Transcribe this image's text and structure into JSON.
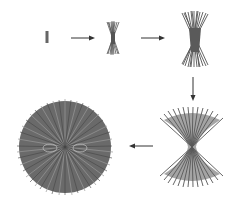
{
  "diagram": {
    "colors": {
      "fiber": "#555555",
      "fiber_light": "#8a8a8a",
      "arrow": "#333333",
      "background": "#ffffff"
    },
    "stages": [
      {
        "id": 1,
        "shape": "single-rod"
      },
      {
        "id": 2,
        "shape": "small-sheaf"
      },
      {
        "id": 3,
        "shape": "large-sheaf"
      },
      {
        "id": 4,
        "shape": "splayed-sheaf"
      },
      {
        "id": 5,
        "shape": "spherulite"
      }
    ],
    "arrows": [
      {
        "from": 1,
        "to": 2,
        "direction": "right"
      },
      {
        "from": 2,
        "to": 3,
        "direction": "right"
      },
      {
        "from": 3,
        "to": 4,
        "direction": "down"
      },
      {
        "from": 4,
        "to": 5,
        "direction": "left"
      }
    ]
  }
}
